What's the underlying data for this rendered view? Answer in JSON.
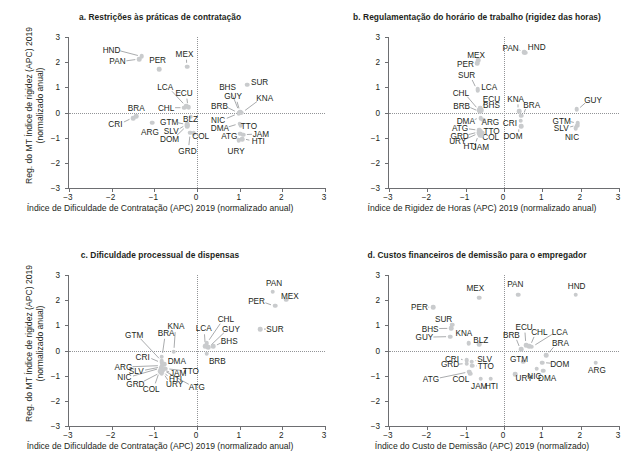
{
  "figure": {
    "width": 634,
    "height": 467,
    "marker_color": "#c9cbcd",
    "axis_color": "#6d6e71",
    "text_color": "#231f20"
  },
  "chart_data": [
    {
      "type": "scatter",
      "panel": "a",
      "title": "a. Restrições às práticas de contratação",
      "xlabel": "Índice de Dificuldade de Contratação (APC) 2019 (normalizado anual)",
      "ylabel": "Reg. do MT Índice de rigidez (APC) 2019 (normalizado anual)",
      "xlim": [
        -3,
        3
      ],
      "ylim": [
        -3,
        3
      ],
      "xticks": [
        -3,
        -2,
        -1,
        0,
        1,
        2,
        3
      ],
      "yticks": [
        -3,
        -2,
        -1,
        0,
        1,
        2,
        3
      ],
      "xticklabels": [
        "−3",
        "−2",
        "−1",
        "0",
        "1",
        "2",
        "3"
      ],
      "yticklabels": [
        "−3",
        "−2",
        "−1",
        "0",
        "1",
        "2",
        "3"
      ],
      "grid": false,
      "zero_reference_lines": true,
      "points": [
        {
          "label": "HND",
          "x": -1.27,
          "y": 2.23,
          "lx": -1.98,
          "ly": 2.5
        },
        {
          "label": "PAN",
          "x": -1.33,
          "y": 2.12,
          "lx": -1.84,
          "ly": 2.03
        },
        {
          "label": "PER",
          "x": -0.86,
          "y": 1.72,
          "lx": -0.9,
          "ly": 2.07
        },
        {
          "label": "MEX",
          "x": -0.2,
          "y": 1.82,
          "lx": -0.27,
          "ly": 2.33
        },
        {
          "label": "LCA",
          "x": -0.23,
          "y": 0.26,
          "lx": -0.72,
          "ly": 1.0
        },
        {
          "label": "ECU",
          "x": -0.17,
          "y": 0.22,
          "lx": -0.28,
          "ly": 0.78
        },
        {
          "label": "CHL",
          "x": -0.27,
          "y": 0.19,
          "lx": -0.7,
          "ly": 0.19
        },
        {
          "label": "BHS",
          "x": 1.02,
          "y": 0.03,
          "lx": 0.74,
          "ly": 1.0
        },
        {
          "label": "SUR",
          "x": 1.2,
          "y": 1.1,
          "lx": 1.49,
          "ly": 1.22
        },
        {
          "label": "GUY",
          "x": 1.05,
          "y": 0.02,
          "lx": 0.87,
          "ly": 0.64
        },
        {
          "label": "KNA",
          "x": 1.07,
          "y": 0.0,
          "lx": 1.61,
          "ly": 0.56
        },
        {
          "label": "BRB",
          "x": 1.0,
          "y": 0.0,
          "lx": 0.55,
          "ly": 0.27
        },
        {
          "label": "BRA",
          "x": -1.4,
          "y": -0.15,
          "lx": -1.4,
          "ly": 0.18
        },
        {
          "label": "CRI",
          "x": -1.47,
          "y": -0.22,
          "lx": -1.89,
          "ly": -0.45
        },
        {
          "label": "ARG",
          "x": -1.02,
          "y": -0.4,
          "lx": -1.08,
          "ly": -0.78
        },
        {
          "label": "GTM",
          "x": -0.21,
          "y": -0.47,
          "lx": -0.63,
          "ly": -0.38
        },
        {
          "label": "SLV",
          "x": -0.21,
          "y": -0.5,
          "lx": -0.58,
          "ly": -0.72
        },
        {
          "label": "DOM",
          "x": -0.21,
          "y": -0.55,
          "lx": -0.62,
          "ly": -1.05
        },
        {
          "label": "BLZ",
          "x": -0.12,
          "y": -0.17,
          "lx": -0.13,
          "ly": -0.27
        },
        {
          "label": "GRD",
          "x": -0.13,
          "y": -0.8,
          "lx": -0.2,
          "ly": -1.53
        },
        {
          "label": "COL",
          "x": -0.05,
          "y": -0.82,
          "lx": 0.11,
          "ly": -0.95
        },
        {
          "label": "NIC",
          "x": 1.0,
          "y": -0.05,
          "lx": 0.52,
          "ly": -0.3
        },
        {
          "label": "DMA",
          "x": 1.02,
          "y": -0.45,
          "lx": 0.56,
          "ly": -0.62
        },
        {
          "label": "TTO",
          "x": 1.05,
          "y": -0.5,
          "lx": 1.24,
          "ly": -0.52
        },
        {
          "label": "ATG",
          "x": 1.04,
          "y": -0.85,
          "lx": 0.78,
          "ly": -0.93
        },
        {
          "label": "JAM",
          "x": 1.1,
          "y": -0.88,
          "lx": 1.52,
          "ly": -0.86
        },
        {
          "label": "HTI",
          "x": 1.08,
          "y": -1.05,
          "lx": 1.46,
          "ly": -1.13
        },
        {
          "label": "URY",
          "x": 1.0,
          "y": -1.1,
          "lx": 0.94,
          "ly": -1.52
        }
      ]
    },
    {
      "type": "scatter",
      "panel": "b",
      "title": "b. Regulamentação do horário de trabalho (rigidez das horas)",
      "xlabel": "Índice de Rigidez de Horas (APC) 2019 (normalizado anual)",
      "ylabel": "Reg. do MT Índice de rigidez (APC) 2019 (normalizado anual)",
      "xlim": [
        -3,
        3
      ],
      "ylim": [
        -3,
        3
      ],
      "xticks": [
        -3,
        -2,
        -1,
        0,
        1,
        2,
        3
      ],
      "yticks": [
        -3,
        -2,
        -1,
        0,
        1,
        2,
        3
      ],
      "xticklabels": [
        "−3",
        "−2",
        "−1",
        "0",
        "1",
        "2",
        "3"
      ],
      "yticklabels": [
        "−3",
        "−2",
        "−1",
        "0",
        "1",
        "2",
        "3"
      ],
      "grid": false,
      "zero_reference_lines": true,
      "points": [
        {
          "label": "PAN",
          "x": 0.55,
          "y": 2.4,
          "lx": 0.2,
          "ly": 2.58
        },
        {
          "label": "HND",
          "x": 0.58,
          "y": 2.38,
          "lx": 0.88,
          "ly": 2.62
        },
        {
          "label": "MEX",
          "x": -0.65,
          "y": 2.08,
          "lx": -0.7,
          "ly": 2.28
        },
        {
          "label": "PER",
          "x": -0.68,
          "y": 1.95,
          "lx": -0.98,
          "ly": 1.93
        },
        {
          "label": "SUR",
          "x": -0.66,
          "y": 0.92,
          "lx": -0.95,
          "ly": 1.48
        },
        {
          "label": "LCA",
          "x": -0.66,
          "y": 0.86,
          "lx": -0.36,
          "ly": 1.02
        },
        {
          "label": "CHL",
          "x": -0.62,
          "y": 0.1,
          "lx": -1.1,
          "ly": 0.79
        },
        {
          "label": "ECU",
          "x": -0.6,
          "y": 0.18,
          "lx": -0.3,
          "ly": 0.53
        },
        {
          "label": "BHS",
          "x": -0.56,
          "y": 0.1,
          "lx": -0.3,
          "ly": 0.28
        },
        {
          "label": "BRB",
          "x": -0.6,
          "y": 0.05,
          "lx": -1.08,
          "ly": 0.26
        },
        {
          "label": "KNA",
          "x": 0.42,
          "y": 0.05,
          "lx": 0.33,
          "ly": 0.55
        },
        {
          "label": "BRA",
          "x": 0.48,
          "y": -0.12,
          "lx": 0.75,
          "ly": 0.31
        },
        {
          "label": "GUY",
          "x": 1.92,
          "y": 0.12,
          "lx": 2.35,
          "ly": 0.5
        },
        {
          "label": "DMA",
          "x": -0.58,
          "y": -0.22,
          "lx": -0.97,
          "ly": -0.32
        },
        {
          "label": "ARG",
          "x": -0.52,
          "y": -0.28,
          "lx": -0.33,
          "ly": -0.36
        },
        {
          "label": "CRI",
          "x": 0.46,
          "y": -0.32,
          "lx": 0.18,
          "ly": -0.4
        },
        {
          "label": "ATG",
          "x": -0.62,
          "y": -0.7,
          "lx": -1.12,
          "ly": -0.63
        },
        {
          "label": "TTO",
          "x": -0.58,
          "y": -0.72,
          "lx": -0.3,
          "ly": -0.73
        },
        {
          "label": "GRD",
          "x": -0.62,
          "y": -0.78,
          "lx": -1.13,
          "ly": -0.92
        },
        {
          "label": "COL",
          "x": -0.55,
          "y": -0.8,
          "lx": -0.32,
          "ly": -0.96
        },
        {
          "label": "URY",
          "x": -0.62,
          "y": -0.83,
          "lx": -1.18,
          "ly": -1.12
        },
        {
          "label": "HTI",
          "x": -0.6,
          "y": -0.9,
          "lx": -0.86,
          "ly": -1.33
        },
        {
          "label": "JAM",
          "x": -0.56,
          "y": -0.9,
          "lx": -0.58,
          "ly": -1.36
        },
        {
          "label": "DOM",
          "x": 0.48,
          "y": -0.55,
          "lx": 0.26,
          "ly": -0.95
        },
        {
          "label": "GTM",
          "x": 1.95,
          "y": -0.42,
          "lx": 1.53,
          "ly": -0.33
        },
        {
          "label": "SLV",
          "x": 1.94,
          "y": -0.52,
          "lx": 1.52,
          "ly": -0.6
        },
        {
          "label": "NIC",
          "x": 1.9,
          "y": -0.62,
          "lx": 1.8,
          "ly": -0.98
        }
      ]
    },
    {
      "type": "scatter",
      "panel": "c",
      "title": "c. Dificuldade processual de dispensas",
      "xlabel": "Índice de Dificuldade de Contratação (APC) 2019 (normalizado anual)",
      "ylabel": "Reg. do MT Índice de rigidez (APC) 2019 (normalizado anual)",
      "xlim": [
        -3,
        3
      ],
      "ylim": [
        -3,
        3
      ],
      "xticks": [
        -3,
        -2,
        -1,
        0,
        1,
        2,
        3
      ],
      "yticks": [
        -3,
        -2,
        -1,
        0,
        1,
        2,
        3
      ],
      "xticklabels": [
        "−3",
        "−2",
        "−1",
        "0",
        "1",
        "2",
        "3"
      ],
      "yticklabels": [
        "−3",
        "−2",
        "−1",
        "0",
        "1",
        "2",
        "3"
      ],
      "grid": false,
      "zero_reference_lines": true,
      "points": [
        {
          "label": "PAN",
          "x": 1.8,
          "y": 2.33,
          "lx": 1.83,
          "ly": 2.7
        },
        {
          "label": "MEX",
          "x": 2.12,
          "y": 2.02,
          "lx": 2.2,
          "ly": 2.18
        },
        {
          "label": "PER",
          "x": 1.85,
          "y": 1.78,
          "lx": 1.42,
          "ly": 1.95
        },
        {
          "label": "SUR",
          "x": 1.5,
          "y": 0.85,
          "lx": 1.85,
          "ly": 0.85
        },
        {
          "label": "CHL",
          "x": 0.25,
          "y": 0.3,
          "lx": 0.7,
          "ly": 1.25
        },
        {
          "label": "LCA",
          "x": 0.22,
          "y": 0.18,
          "lx": 0.18,
          "ly": 0.88
        },
        {
          "label": "GUY",
          "x": 0.28,
          "y": 0.12,
          "lx": 0.82,
          "ly": 0.85
        },
        {
          "label": "BHS",
          "x": 0.4,
          "y": 0.18,
          "lx": 0.78,
          "ly": 0.36
        },
        {
          "label": "KNA",
          "x": -0.52,
          "y": -0.05,
          "lx": -0.47,
          "ly": 0.97
        },
        {
          "label": "BRA",
          "x": -0.8,
          "y": -0.25,
          "lx": -0.7,
          "ly": 0.7
        },
        {
          "label": "GTM",
          "x": -0.8,
          "y": -0.42,
          "lx": -1.45,
          "ly": 0.63
        },
        {
          "label": "CRI",
          "x": -0.8,
          "y": -0.48,
          "lx": -1.25,
          "ly": -0.25
        },
        {
          "label": "BRB",
          "x": 0.25,
          "y": -0.12,
          "lx": 0.5,
          "ly": -0.4
        },
        {
          "label": "DMA",
          "x": -0.74,
          "y": -0.55,
          "lx": -0.45,
          "ly": -0.42
        },
        {
          "label": "ARG",
          "x": -0.8,
          "y": -0.6,
          "lx": -1.7,
          "ly": -0.65
        },
        {
          "label": "SLV",
          "x": -0.8,
          "y": -0.65,
          "lx": -1.4,
          "ly": -0.82
        },
        {
          "label": "JAM",
          "x": -0.78,
          "y": -0.78,
          "lx": -0.42,
          "ly": -0.9
        },
        {
          "label": "TTO",
          "x": -0.72,
          "y": -0.72,
          "lx": -0.12,
          "ly": -0.82
        },
        {
          "label": "NIC",
          "x": -0.82,
          "y": -0.7,
          "lx": -1.68,
          "ly": -1.07
        },
        {
          "label": "HTI",
          "x": -0.8,
          "y": -0.85,
          "lx": -0.48,
          "ly": -1.12
        },
        {
          "label": "GRD",
          "x": -0.82,
          "y": -0.88,
          "lx": -1.42,
          "ly": -1.32
        },
        {
          "label": "URY",
          "x": -0.8,
          "y": -0.9,
          "lx": -0.5,
          "ly": -1.32
        },
        {
          "label": "COL",
          "x": -0.84,
          "y": -0.82,
          "lx": -1.05,
          "ly": -1.52
        },
        {
          "label": "ATG",
          "x": -0.78,
          "y": -0.78,
          "lx": 0.02,
          "ly": -1.45
        }
      ]
    },
    {
      "type": "scatter",
      "panel": "d",
      "title": "d. Custos financeiros de demissão para o empregador",
      "xlabel": "Índice do Custo de Demissão (APC) 2019 (normalizado)",
      "ylabel": "Reg. do MT Índice de rigidez (APC) 2019 (normalizado anual)",
      "xlim": [
        -3,
        3
      ],
      "ylim": [
        -3,
        3
      ],
      "xticks": [
        -3,
        -2,
        -1,
        0,
        1,
        2,
        3
      ],
      "yticks": [
        -3,
        -2,
        -1,
        0,
        1,
        2,
        3
      ],
      "xticklabels": [
        "−3",
        "−2",
        "−1",
        "0",
        "1",
        "2",
        "3"
      ],
      "yticklabels": [
        "−3",
        "−2",
        "−1",
        "0",
        "1",
        "2",
        "3"
      ],
      "grid": false,
      "zero_reference_lines": true,
      "points": [
        {
          "label": "PAN",
          "x": 0.4,
          "y": 2.22,
          "lx": 0.32,
          "ly": 2.65
        },
        {
          "label": "HND",
          "x": 1.9,
          "y": 2.22,
          "lx": 1.92,
          "ly": 2.58
        },
        {
          "label": "MEX",
          "x": -0.62,
          "y": 2.1,
          "lx": -0.72,
          "ly": 2.48
        },
        {
          "label": "PER",
          "x": -1.82,
          "y": 1.72,
          "lx": -2.18,
          "ly": 1.72
        },
        {
          "label": "SUR",
          "x": -1.32,
          "y": 1.02,
          "lx": -1.55,
          "ly": 1.25
        },
        {
          "label": "BHS",
          "x": -1.35,
          "y": 0.88,
          "lx": -1.9,
          "ly": 0.87
        },
        {
          "label": "GUY",
          "x": -1.38,
          "y": 0.55,
          "lx": -2.05,
          "ly": 0.53
        },
        {
          "label": "KNA",
          "x": -0.9,
          "y": 0.3,
          "lx": -1.02,
          "ly": 0.68
        },
        {
          "label": "BLZ",
          "x": -0.62,
          "y": 0.25,
          "lx": -0.58,
          "ly": 0.4
        },
        {
          "label": "ECU",
          "x": 0.6,
          "y": 0.22,
          "lx": 0.55,
          "ly": 0.95
        },
        {
          "label": "CHL",
          "x": 0.68,
          "y": 0.18,
          "lx": 0.95,
          "ly": 0.73
        },
        {
          "label": "LCA",
          "x": 0.75,
          "y": 0.15,
          "lx": 1.48,
          "ly": 0.75
        },
        {
          "label": "BRB",
          "x": 0.48,
          "y": 0.05,
          "lx": 0.22,
          "ly": 0.62
        },
        {
          "label": "BRA",
          "x": 1.12,
          "y": -0.18,
          "lx": 1.5,
          "ly": 0.28
        },
        {
          "label": "CRI",
          "x": -0.95,
          "y": -0.38,
          "lx": -1.33,
          "ly": -0.32
        },
        {
          "label": "SLV",
          "x": -0.82,
          "y": -0.45,
          "lx": -0.48,
          "ly": -0.35
        },
        {
          "label": "GRD",
          "x": -0.95,
          "y": -0.52,
          "lx": -1.38,
          "ly": -0.55
        },
        {
          "label": "TTO",
          "x": -0.8,
          "y": -0.6,
          "lx": -0.45,
          "ly": -0.63
        },
        {
          "label": "GTM",
          "x": 0.52,
          "y": -0.45,
          "lx": 0.42,
          "ly": -0.33
        },
        {
          "label": "DOM",
          "x": 1.02,
          "y": -0.48,
          "lx": 1.48,
          "ly": -0.52
        },
        {
          "label": "ARG",
          "x": 2.42,
          "y": -0.48,
          "lx": 2.45,
          "ly": -0.78
        },
        {
          "label": "COL",
          "x": -0.85,
          "y": -0.92,
          "lx": -1.1,
          "ly": -1.12
        },
        {
          "label": "ATG",
          "x": -0.88,
          "y": -0.85,
          "lx": -1.88,
          "ly": -1.13
        },
        {
          "label": "NIC",
          "x": 0.88,
          "y": -0.72,
          "lx": 0.82,
          "ly": -1.02
        },
        {
          "label": "DMA",
          "x": 1.05,
          "y": -0.8,
          "lx": 1.15,
          "ly": -1.08
        },
        {
          "label": "URY",
          "x": 0.32,
          "y": -0.95,
          "lx": 0.55,
          "ly": -1.08
        },
        {
          "label": "JAM",
          "x": -0.58,
          "y": -1.12,
          "lx": -0.62,
          "ly": -1.42
        },
        {
          "label": "HTI",
          "x": -0.32,
          "y": -1.12,
          "lx": -0.3,
          "ly": -1.4
        }
      ]
    }
  ]
}
